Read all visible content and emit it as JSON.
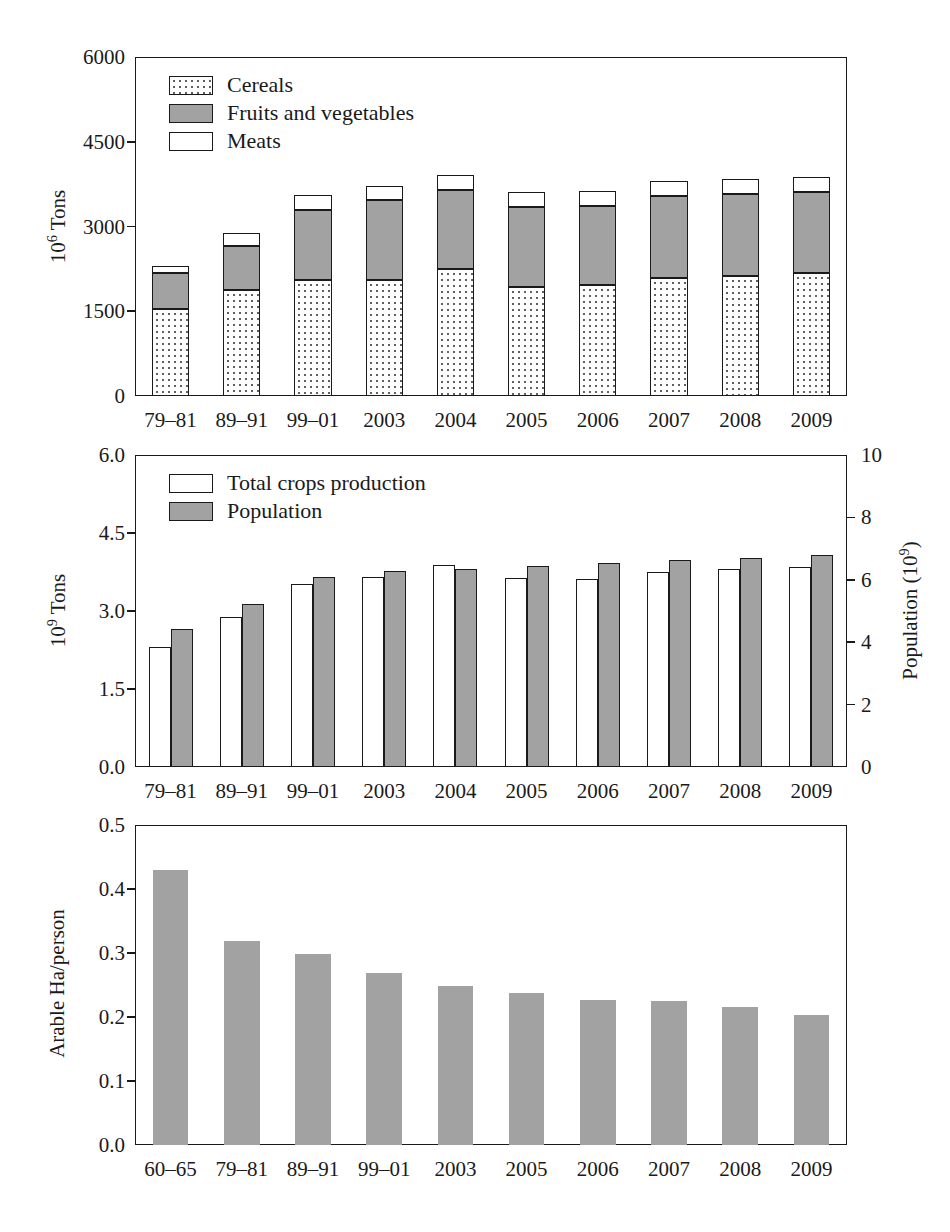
{
  "figure": {
    "background": "#ffffff",
    "ink": "#1a1a1a",
    "gray_fill": "#a2a2a2"
  },
  "chart_data": [
    {
      "id": "panel-a",
      "type": "bar",
      "stacked": true,
      "title": "",
      "xlabel": "",
      "ylabel": "10⁶ Tons",
      "ylim": [
        0,
        6000
      ],
      "yticks": [
        "0",
        "1500",
        "3000",
        "4500",
        "6000"
      ],
      "ytick_values": [
        0,
        1500,
        3000,
        4500,
        6000
      ],
      "grid": false,
      "legend_position": "upper-left",
      "categories": [
        "79–81",
        "89–91",
        "99–01",
        "2003",
        "2004",
        "2005",
        "2006",
        "2007",
        "2008",
        "2009"
      ],
      "series": [
        {
          "name": "Cereals",
          "fill": "dotted",
          "values": [
            1540,
            1870,
            2060,
            2060,
            2250,
            1930,
            1960,
            2080,
            2130,
            2180
          ]
        },
        {
          "name": "Fruits and vegetables",
          "fill": "gray",
          "values": [
            630,
            780,
            1230,
            1410,
            1400,
            1420,
            1400,
            1460,
            1440,
            1430
          ]
        },
        {
          "name": "Meats",
          "fill": "white",
          "values": [
            130,
            230,
            260,
            250,
            270,
            260,
            260,
            260,
            270,
            260
          ]
        }
      ],
      "totals": [
        2300,
        2880,
        3550,
        3720,
        3920,
        3610,
        3620,
        3800,
        3840,
        3870
      ]
    },
    {
      "id": "panel-b",
      "type": "bar",
      "stacked": false,
      "grouped": true,
      "title": "",
      "xlabel": "",
      "ylabel": "10⁹ Tons",
      "ylabel_right": "Population (10⁹)",
      "ylim": [
        0,
        6.0
      ],
      "yticks": [
        "0.0",
        "1.5",
        "3.0",
        "4.5",
        "6.0"
      ],
      "ytick_values": [
        0.0,
        1.5,
        3.0,
        4.5,
        6.0
      ],
      "ylim_right": [
        0,
        10
      ],
      "yticks_right": [
        "0",
        "2",
        "4",
        "6",
        "8",
        "10"
      ],
      "ytick_values_right": [
        0,
        2,
        4,
        6,
        8,
        10
      ],
      "grid": false,
      "legend_position": "upper-left",
      "categories": [
        "79–81",
        "89–91",
        "99–01",
        "2003",
        "2004",
        "2005",
        "2006",
        "2007",
        "2008",
        "2009"
      ],
      "series": [
        {
          "name": "Total crops production",
          "fill": "white",
          "axis": "left",
          "values": [
            2.3,
            2.88,
            3.52,
            3.66,
            3.88,
            3.63,
            3.62,
            3.75,
            3.8,
            3.85
          ]
        },
        {
          "name": "Population",
          "fill": "gray",
          "axis": "right",
          "values": [
            4.43,
            5.24,
            6.08,
            6.28,
            6.35,
            6.45,
            6.55,
            6.63,
            6.69,
            6.78
          ]
        }
      ]
    },
    {
      "id": "panel-c",
      "type": "bar",
      "stacked": false,
      "title": "",
      "xlabel": "",
      "ylabel": "Arable Ha/person",
      "ylim": [
        0,
        0.5
      ],
      "yticks": [
        "0.0",
        "0.1",
        "0.2",
        "0.3",
        "0.4",
        "0.5"
      ],
      "ytick_values": [
        0.0,
        0.1,
        0.2,
        0.3,
        0.4,
        0.5
      ],
      "grid": false,
      "legend_position": "none",
      "categories": [
        "60–65",
        "79–81",
        "89–91",
        "99–01",
        "2003",
        "2005",
        "2006",
        "2007",
        "2008",
        "2009"
      ],
      "series": [
        {
          "name": "Arable Ha/person",
          "fill": "gray",
          "values": [
            0.43,
            0.318,
            0.298,
            0.269,
            0.248,
            0.237,
            0.226,
            0.225,
            0.215,
            0.203
          ]
        }
      ]
    }
  ]
}
